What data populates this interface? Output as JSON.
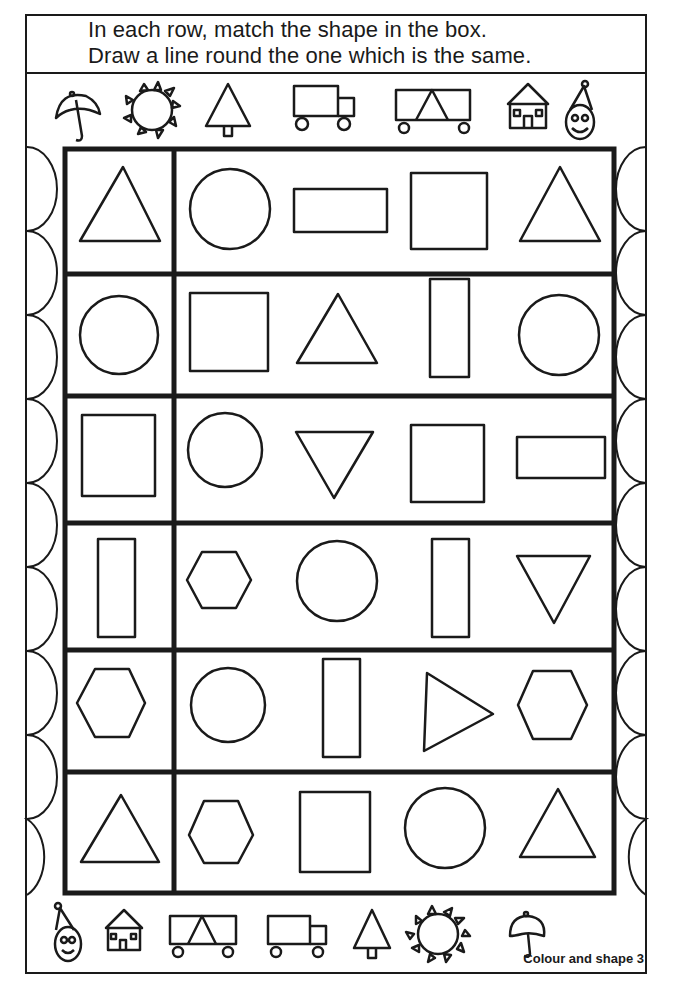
{
  "instructions": {
    "line1": "In each row, match the shape in the box.",
    "line2": "Draw a line round the one which is the same."
  },
  "top_icons": [
    "umbrella-icon",
    "sun-icon",
    "tree-icon",
    "truck-icon",
    "tent-wagon-icon",
    "house-icon",
    "clown-icon"
  ],
  "bottom_icons": [
    "clown-icon",
    "house-icon",
    "tent-wagon-icon",
    "truck-icon",
    "tree-icon",
    "sun-icon",
    "umbrella-icon"
  ],
  "footer": {
    "label": "Colour and shape 3"
  },
  "colors": {
    "ink": "#1a1a1a",
    "paper": "#ffffff"
  },
  "rows": [
    {
      "target": "triangle-up",
      "choices": [
        "circle",
        "rectangle-wide",
        "square",
        "triangle-up"
      ]
    },
    {
      "target": "circle",
      "choices": [
        "square",
        "triangle-up",
        "rectangle-tall",
        "circle"
      ]
    },
    {
      "target": "square",
      "choices": [
        "circle",
        "triangle-down",
        "square",
        "rectangle-wide"
      ]
    },
    {
      "target": "rectangle-tall",
      "choices": [
        "hexagon",
        "circle",
        "rectangle-tall",
        "triangle-down"
      ]
    },
    {
      "target": "hexagon",
      "choices": [
        "circle",
        "rectangle-tall",
        "triangle-right",
        "hexagon"
      ]
    },
    {
      "target": "triangle-up",
      "choices": [
        "hexagon",
        "square",
        "circle",
        "triangle-up"
      ]
    }
  ]
}
